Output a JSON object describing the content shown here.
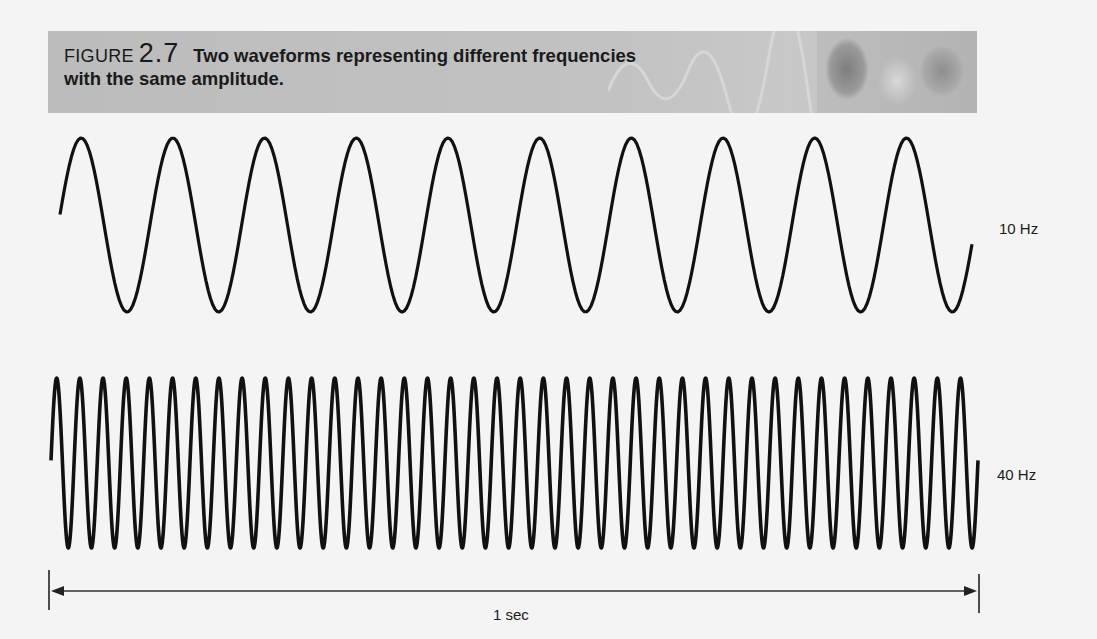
{
  "caption": {
    "figure_word": "FIGURE",
    "figure_number": "2.7",
    "title_line1": "Two waveforms representing different frequencies",
    "title_line2": "with the same amplitude."
  },
  "colors": {
    "header_bar": "#bdbdbd",
    "wave_stroke": "#111111",
    "background": "#f4f4f4"
  },
  "chart_data": {
    "type": "line",
    "title": "Two waveforms representing different frequencies with the same amplitude.",
    "xlabel": "1 sec",
    "ylabel": "",
    "x_range": [
      0,
      1
    ],
    "x_unit": "seconds",
    "series": [
      {
        "name": "10 Hz",
        "frequency_hz": 10,
        "cycles_in_window": 10,
        "amplitude": 1,
        "waveform": "sine"
      },
      {
        "name": "40 Hz",
        "frequency_hz": 40,
        "cycles_in_window": 40,
        "amplitude": 1,
        "waveform": "sine"
      }
    ],
    "grid": false,
    "legend": "labels at right of each wave"
  },
  "labels": {
    "wave_top": "10 Hz",
    "wave_bottom": "40 Hz",
    "time_axis": "1 sec"
  }
}
